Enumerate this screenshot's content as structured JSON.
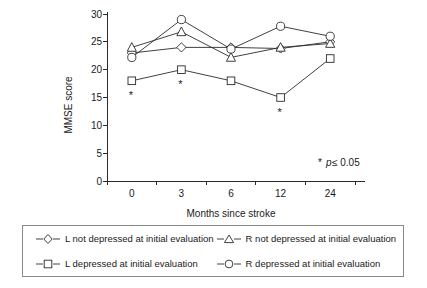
{
  "chart_data": {
    "type": "line",
    "title": "",
    "xlabel": "Months since stroke",
    "ylabel": "MMSE score",
    "categories": [
      "0",
      "3",
      "6",
      "12",
      "24"
    ],
    "x_tick_labels": [
      "0",
      "3",
      "6",
      "12",
      "24"
    ],
    "y_tick_labels": [
      "0",
      "5",
      "10",
      "15",
      "20",
      "25",
      "30"
    ],
    "y_ticks": [
      0,
      5,
      10,
      15,
      20,
      25,
      30
    ],
    "ylim": [
      0,
      30
    ],
    "grid": false,
    "legend_position": "bottom",
    "series": [
      {
        "name": "L not depressed at initial evaluation",
        "marker": "diamond",
        "values": [
          23.0,
          24.0,
          24.0,
          23.8,
          25.0
        ]
      },
      {
        "name": "R not depressed at initial evaluation",
        "marker": "triangle",
        "values": [
          24.0,
          26.8,
          22.2,
          24.0,
          24.7
        ]
      },
      {
        "name": "L depressed at initial evaluation",
        "marker": "square",
        "values": [
          18.0,
          20.0,
          18.0,
          15.0,
          22.0
        ]
      },
      {
        "name": "R depressed at initial evaluation",
        "marker": "circle",
        "values": [
          22.2,
          29.0,
          23.7,
          27.8,
          26.0
        ]
      }
    ],
    "annotations": [
      {
        "text": "*",
        "category": "0",
        "series": "L depressed at initial evaluation",
        "value": 18.0
      },
      {
        "text": "*",
        "category": "3",
        "series": "L depressed at initial evaluation",
        "value": 20.0
      },
      {
        "text": "*",
        "category": "12",
        "series": "L depressed at initial evaluation",
        "value": 15.0
      }
    ],
    "footnote": {
      "star": "*",
      "italic": "p",
      "rest": " ≤ 0.05"
    },
    "colors": {
      "line": "#2b2b2b",
      "marker_fill": "#ffffff",
      "axis": "#2b2b2b",
      "text": "#1a1a1a",
      "legend_border": "#8a8a8a"
    }
  },
  "legend": {
    "items": [
      {
        "label": "L not depressed at initial evaluation",
        "marker": "diamond"
      },
      {
        "label": "R not depressed at initial evaluation",
        "marker": "triangle"
      },
      {
        "label": "L depressed at initial evaluation",
        "marker": "square"
      },
      {
        "label": "R depressed at initial evaluation",
        "marker": "circle"
      }
    ]
  }
}
